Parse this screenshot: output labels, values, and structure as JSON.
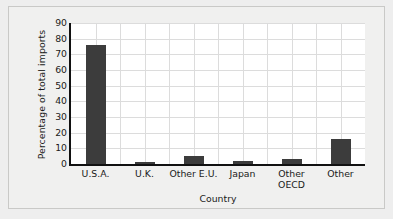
{
  "chart_data": {
    "type": "bar",
    "title": "",
    "xlabel": "Country",
    "ylabel": "Percentage of total imports",
    "categories": [
      "U.S.A.",
      "U.K.",
      "Other E.U.",
      "Japan",
      "Other\nOECD",
      "Other"
    ],
    "values": [
      76,
      1,
      5,
      2,
      3,
      16
    ],
    "ylim": [
      0,
      90
    ],
    "yticks": [
      0,
      10,
      20,
      30,
      40,
      50,
      60,
      70,
      80,
      90
    ],
    "ytick_labels": [
      "0",
      "10",
      "20",
      "30",
      "40",
      "50",
      "60",
      "70",
      "80",
      "90"
    ],
    "grid": "both",
    "legend": "none",
    "bar_color": "#3c3c3c",
    "grid_color": "#dcdcdc",
    "axis_color": "#111111",
    "plot_background": "#ffffff",
    "figure_background": "#f0f0ef"
  }
}
